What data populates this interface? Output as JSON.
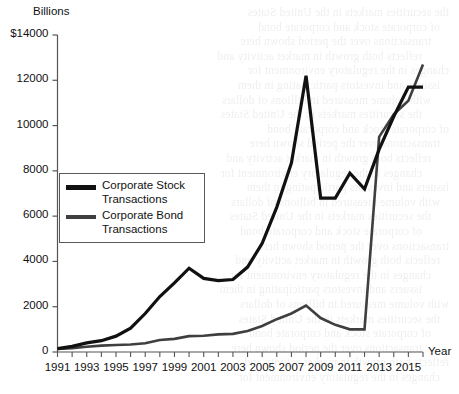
{
  "chart_data": {
    "type": "line",
    "title": "",
    "ylabel": "Billions",
    "xlabel": "Year",
    "ylim": [
      0,
      14000
    ],
    "xlim": [
      1991,
      2016
    ],
    "ytick_labels": [
      "0",
      "2000",
      "4000",
      "6000",
      "8000",
      "10000",
      "12000",
      "$14000"
    ],
    "ytick_values": [
      0,
      2000,
      4000,
      6000,
      8000,
      10000,
      12000,
      14000
    ],
    "xtick_labels": [
      "1991",
      "1993",
      "1995",
      "1997",
      "1999",
      "2001",
      "2003",
      "2005",
      "2007",
      "2009",
      "2011",
      "2013",
      "2015"
    ],
    "xtick_values": [
      1991,
      1993,
      1995,
      1997,
      1999,
      2001,
      2003,
      2005,
      2007,
      2009,
      2011,
      2013,
      2015
    ],
    "minor_xticks": [
      1991,
      1992,
      1993,
      1994,
      1995,
      1996,
      1997,
      1998,
      1999,
      2000,
      2001,
      2002,
      2003,
      2004,
      2005,
      2006,
      2007,
      2008,
      2009,
      2010,
      2011,
      2012,
      2013,
      2014,
      2015,
      2016
    ],
    "grid": false,
    "legend_position": "center-left",
    "x": [
      1991,
      1992,
      1993,
      1994,
      1995,
      1996,
      1997,
      1998,
      1999,
      2000,
      2001,
      2002,
      2003,
      2004,
      2005,
      2006,
      2007,
      2008,
      2009,
      2010,
      2011,
      2012,
      2013,
      2014,
      2015,
      2016
    ],
    "series": [
      {
        "name": "Corporate Stock Transactions",
        "color": "#111111",
        "width": 3.2,
        "values": [
          150,
          250,
          400,
          500,
          700,
          1050,
          1700,
          2450,
          3050,
          3700,
          3250,
          3150,
          3200,
          3750,
          4800,
          6400,
          8350,
          12200,
          6800,
          6800,
          7900,
          7200,
          8950,
          10400,
          11700,
          11700
        ]
      },
      {
        "name": "Corporate Bond Transactions",
        "color": "#3f3f3f",
        "width": 2.6,
        "values": [
          130,
          170,
          230,
          280,
          310,
          330,
          390,
          530,
          580,
          700,
          720,
          780,
          800,
          930,
          1150,
          1450,
          1700,
          2050,
          1500,
          1200,
          1000,
          1000,
          9500,
          10500,
          11100,
          12700
        ]
      }
    ]
  },
  "legend": {
    "items": [
      {
        "label": "Corporate Stock\nTransactions",
        "series": "Corporate Stock Transactions"
      },
      {
        "label": "Corporate Bond\nTransactions",
        "series": "Corporate Bond Transactions"
      }
    ]
  },
  "background_text": {
    "note": "faint bleed-through text from reverse side of scanned page",
    "lines": [
      "the securities markets in the United States",
      "of corporate stock and corporate bond",
      "transactions over the period shown here",
      "reflects both growth in market activity and",
      "changes in the regulatory environment for",
      "issuers and investors participating in them",
      "with volume measured in billions of dollars"
    ]
  },
  "colors": {
    "stock_line": "#111111",
    "bond_line": "#3f3f3f",
    "axis": "#555555",
    "text": "#111111",
    "background": "#ffffff"
  }
}
